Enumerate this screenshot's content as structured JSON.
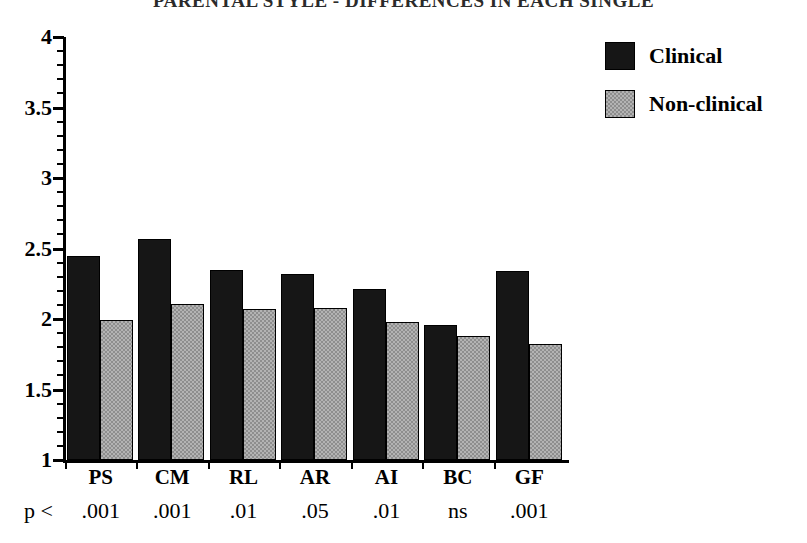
{
  "title": "PARENTAL STYLE - DIFFERENCES IN EACH SINGLE",
  "legend": {
    "position": "top-right",
    "entries": [
      {
        "label": "Clinical",
        "color": "#161616",
        "swatch": "black-solid"
      },
      {
        "label": "Non-clinical",
        "color": "#b3b3b3",
        "swatch": "gray-dither"
      }
    ]
  },
  "axis": {
    "y_tick_labels": [
      "4",
      "3.5",
      "3",
      "2.5",
      "2",
      "1.5",
      "1"
    ],
    "y_tick_values": [
      4,
      3.5,
      3,
      2.5,
      2,
      1.5,
      1
    ],
    "y_min": 1,
    "y_max": 4,
    "minor_tick_step": 0.1,
    "p_prefix": "p <"
  },
  "chart_data": {
    "type": "bar",
    "title": "PARENTAL STYLE - DIFFERENCES IN EACH SINGLE",
    "xlabel": "",
    "ylabel": "",
    "ylim": [
      1,
      4
    ],
    "yticks": [
      1,
      1.5,
      2,
      2.5,
      3,
      3.5,
      4
    ],
    "grid": false,
    "legend_position": "top-right",
    "categories": [
      "PS",
      "CM",
      "RL",
      "AR",
      "AI",
      "BC",
      "GF"
    ],
    "p_values": [
      ".001",
      ".001",
      ".01",
      ".05",
      ".01",
      "ns",
      ".001"
    ],
    "series": [
      {
        "name": "Clinical",
        "color": "#161616",
        "values": [
          2.45,
          2.57,
          2.35,
          2.32,
          2.21,
          1.96,
          2.34
        ]
      },
      {
        "name": "Non-clinical",
        "color": "#b3b3b3",
        "values": [
          1.99,
          2.11,
          2.07,
          2.08,
          1.98,
          1.88,
          1.82
        ]
      }
    ]
  }
}
